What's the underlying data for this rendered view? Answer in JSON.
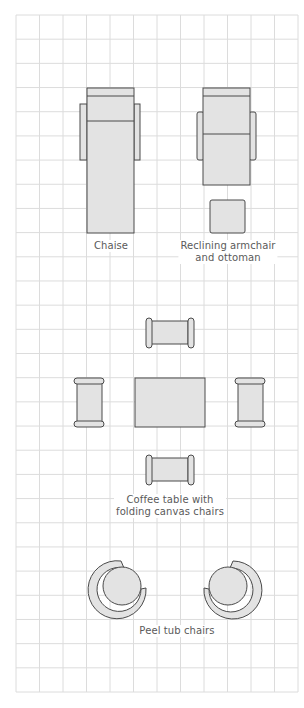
{
  "diagram": {
    "type": "furniture-floor-plan",
    "grid": {
      "columns": 12,
      "rows": 28,
      "line_color": "#dcdcdc"
    },
    "colors": {
      "fill": "#e3e3e3",
      "stroke": "#4a4a4a",
      "label": "#5a5a5a"
    },
    "groups": [
      {
        "id": "chaise",
        "label_lines": [
          "Chaise"
        ]
      },
      {
        "id": "recliner",
        "label_lines": [
          "Reclining armchair",
          "and ottoman"
        ]
      },
      {
        "id": "coffee-table",
        "label_lines": [
          "Coffee table with",
          "folding canvas chairs"
        ]
      },
      {
        "id": "tub-chairs",
        "label_lines": [
          "Peel tub chairs"
        ]
      }
    ]
  }
}
